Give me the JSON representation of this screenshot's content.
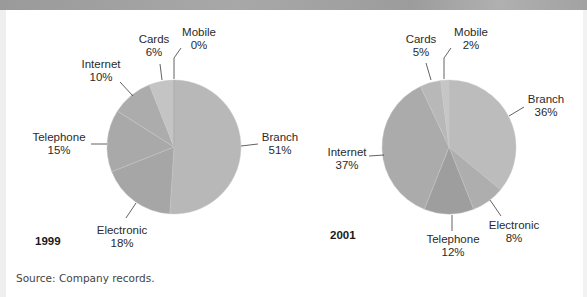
{
  "source_note": "Source: Company records.",
  "chart_data": [
    {
      "type": "pie",
      "title": "1999",
      "start_angle": "12 o'clock",
      "direction": "clockwise",
      "categories": [
        "Branch",
        "Electronic",
        "Telephone",
        "Internet",
        "Cards",
        "Mobile"
      ],
      "values": [
        51,
        18,
        15,
        10,
        6,
        0
      ],
      "labels": [
        "51%",
        "18%",
        "15%",
        "10%",
        "6%",
        "0%"
      ],
      "colors": [
        "#b8b8b8",
        "#a6a6a6",
        "#a9a9a9",
        "#acacac",
        "#c4c4c4",
        "#c9c9c9"
      ]
    },
    {
      "type": "pie",
      "title": "2001",
      "start_angle": "12 o'clock",
      "direction": "clockwise",
      "categories": [
        "Branch",
        "Electronic",
        "Telephone",
        "Internet",
        "Cards",
        "Mobile"
      ],
      "values": [
        36,
        8,
        12,
        37,
        5,
        2
      ],
      "labels": [
        "36%",
        "8%",
        "12%",
        "37%",
        "5%",
        "2%"
      ],
      "colors": [
        "#bcbcbc",
        "#aeaeae",
        "#9e9e9e",
        "#ababab",
        "#b8b8b8",
        "#c6c6c6"
      ]
    }
  ],
  "pies": [
    {
      "year": "1999",
      "labels": {
        "branch": {
          "name": "Branch",
          "pct": "51%"
        },
        "electronic": {
          "name": "Electronic",
          "pct": "18%"
        },
        "telephone": {
          "name": "Telephone",
          "pct": "15%"
        },
        "internet": {
          "name": "Internet",
          "pct": "10%"
        },
        "cards": {
          "name": "Cards",
          "pct": "6%"
        },
        "mobile": {
          "name": "Mobile",
          "pct": "0%"
        }
      }
    },
    {
      "year": "2001",
      "labels": {
        "branch": {
          "name": "Branch",
          "pct": "36%"
        },
        "electronic": {
          "name": "Electronic",
          "pct": "8%"
        },
        "telephone": {
          "name": "Telephone",
          "pct": "12%"
        },
        "internet": {
          "name": "Internet",
          "pct": "37%"
        },
        "cards": {
          "name": "Cards",
          "pct": "5%"
        },
        "mobile": {
          "name": "Mobile",
          "pct": "2%"
        }
      }
    }
  ]
}
